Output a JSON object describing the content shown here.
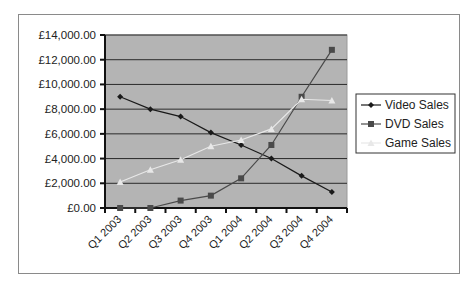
{
  "chart_data": {
    "type": "line",
    "title": "",
    "xlabel": "",
    "ylabel": "",
    "categories": [
      "Q1 2003",
      "Q2 2003",
      "Q3 2003",
      "Q4 2003",
      "Q1 2004",
      "Q2 2004",
      "Q3 2004",
      "Q4 2004"
    ],
    "series": [
      {
        "name": "Video Sales",
        "marker": "diamond",
        "color": "#1a1a1a",
        "values": [
          9000,
          8000,
          7400,
          6100,
          5100,
          4000,
          2600,
          1300
        ]
      },
      {
        "name": "DVD Sales",
        "marker": "square",
        "color": "#4a4a4a",
        "values": [
          0,
          0,
          600,
          1000,
          2400,
          5100,
          9000,
          12800
        ]
      },
      {
        "name": "Game Sales",
        "marker": "triangle",
        "color": "#e8e8e8",
        "values": [
          2100,
          3100,
          3900,
          5000,
          5500,
          6400,
          8800,
          8700
        ]
      }
    ],
    "ylim": [
      0,
      14000
    ],
    "yticks": [
      0,
      2000,
      4000,
      6000,
      8000,
      10000,
      12000,
      14000
    ],
    "ytick_labels": [
      "£0.00",
      "£2,000.00",
      "£4,000.00",
      "£6,000.00",
      "£8,000.00",
      "£10,000.00",
      "£12,000.00",
      "£14,000.00"
    ],
    "grid": true,
    "legend_position": "right",
    "plot_background": "#b4b4b4"
  }
}
